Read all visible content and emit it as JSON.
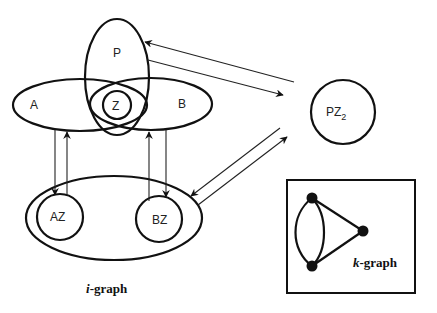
{
  "diagram": {
    "sets": {
      "P": {
        "label": "P",
        "cx": 117,
        "cy": 77,
        "rx": 32,
        "ry": 58
      },
      "A": {
        "label": "A",
        "cx": 80,
        "cy": 105,
        "rx": 67,
        "ry": 26
      },
      "B": {
        "label": "B",
        "cx": 151,
        "cy": 104,
        "rx": 61,
        "ry": 26
      },
      "Z": {
        "label": "Z",
        "cx": 117,
        "cy": 105,
        "r": 14
      }
    },
    "pz2": {
      "label_main": "PZ",
      "label_sub": "2",
      "cx": 343,
      "cy": 112,
      "r": 32
    },
    "i_graph": {
      "caption_italic": "i",
      "caption_rest": "-graph",
      "outer": {
        "cx": 114,
        "cy": 218,
        "rx": 88,
        "ry": 42
      },
      "nodes": [
        {
          "label": "AZ",
          "cx": 60,
          "cy": 217,
          "r": 23
        },
        {
          "label": "BZ",
          "cx": 159,
          "cy": 219,
          "r": 23
        }
      ]
    },
    "k_graph": {
      "caption_italic": "k",
      "caption_rest": "-graph",
      "box": {
        "x": 287,
        "y": 180,
        "w": 128,
        "h": 113
      },
      "nodes": [
        {
          "cx": 312,
          "cy": 198
        },
        {
          "cx": 312,
          "cy": 266
        },
        {
          "cx": 363,
          "cy": 231
        }
      ]
    },
    "edges": [
      {
        "from": "PZ2",
        "to": "P",
        "direction": "to P"
      },
      {
        "from": "P",
        "to": "PZ2",
        "direction": "to PZ2"
      },
      {
        "from": "A",
        "to": "AZ",
        "direction": "down"
      },
      {
        "from": "AZ",
        "to": "A",
        "direction": "up"
      },
      {
        "from": "BZ",
        "to": "B",
        "direction": "up"
      },
      {
        "from": "B",
        "to": "BZ",
        "direction": "down"
      },
      {
        "from": "PZ2",
        "to": "i-graph",
        "direction": "to i-graph"
      },
      {
        "from": "i-graph",
        "to": "PZ2",
        "direction": "to PZ2"
      }
    ],
    "colors": {
      "stroke": "#111111",
      "background": "#ffffff"
    }
  }
}
